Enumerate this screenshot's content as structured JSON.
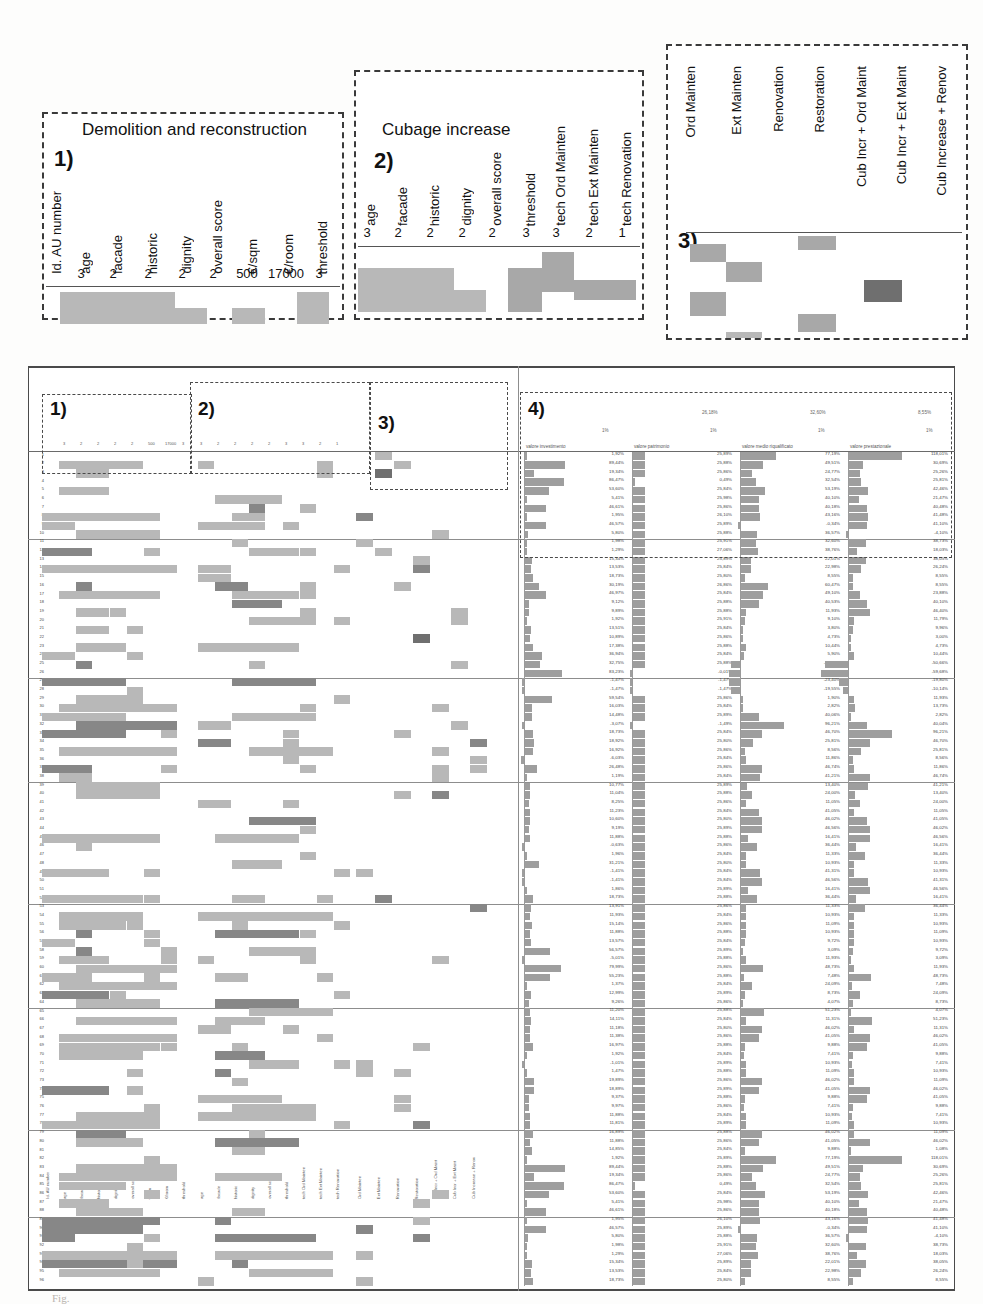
{
  "document": {
    "type": "figure",
    "caption": "Fig."
  },
  "colors": {
    "cell_light": "#b8b8b8",
    "cell_mid": "#a8a8a8",
    "cell_dark": "#878787",
    "cell_darkest": "#6f6f6f",
    "bar": "#9e9e9e",
    "frame": "#3a3a3a",
    "rule": "#555555",
    "background": "#ffffff"
  },
  "callouts": [
    {
      "id": "callout-1",
      "number": "1)",
      "title": "Demolition and reconstruction",
      "columns": [
        {
          "label": "Id. AU number",
          "value": ""
        },
        {
          "label": "age",
          "value": "3"
        },
        {
          "label": "facade",
          "value": "2"
        },
        {
          "label": "historic",
          "value": "2"
        },
        {
          "label": "dignity",
          "value": "2"
        },
        {
          "label": "overall score",
          "value": "2"
        },
        {
          "label": "€/sqm",
          "value": "500"
        },
        {
          "label": "€/room",
          "value": "17000"
        },
        {
          "label": "threshold",
          "value": "3"
        }
      ],
      "cells": [
        {
          "row": 0,
          "col_start": 1,
          "col_end": 5,
          "shade": "cell_light"
        },
        {
          "row": 0,
          "col_start": 8,
          "col_end": 9,
          "shade": "cell_light"
        },
        {
          "row": 1,
          "col_start": 1,
          "col_end": 4,
          "shade": "cell_light"
        },
        {
          "row": 1,
          "col_start": 6,
          "col_end": 7,
          "shade": "cell_light"
        },
        {
          "row": 1,
          "col_start": 8,
          "col_end": 9,
          "shade": "cell_light"
        }
      ]
    },
    {
      "id": "callout-2",
      "number": "2)",
      "title": "Cubage increase",
      "columns": [
        {
          "label": "age",
          "value": "3"
        },
        {
          "label": "facade",
          "value": "2"
        },
        {
          "label": "historic",
          "value": "2"
        },
        {
          "label": "dignity",
          "value": "2"
        },
        {
          "label": "overall score",
          "value": "2"
        },
        {
          "label": "threshold",
          "value": "3"
        },
        {
          "label": "tech Ord Mainten",
          "value": "3"
        },
        {
          "label": "tech Ext Mainten",
          "value": "2"
        },
        {
          "label": "tech Renovation",
          "value": "1"
        }
      ],
      "cells": [
        {
          "row": 0,
          "col_start": 5,
          "col_end": 7,
          "shade": "cell_mid"
        },
        {
          "row": 1,
          "col_start": 0,
          "col_end": 4,
          "shade": "cell_light"
        },
        {
          "row": 1,
          "col_start": 5,
          "col_end": 7,
          "shade": "cell_mid"
        },
        {
          "row": 1,
          "col_start": 7,
          "col_end": 9,
          "shade": "cell_mid"
        },
        {
          "row": 2,
          "col_start": 0,
          "col_end": 3,
          "shade": "cell_light"
        },
        {
          "row": 2,
          "col_start": 5,
          "col_end": 6,
          "shade": "cell_mid"
        },
        {
          "row": 2,
          "col_start": 7,
          "col_end": 9,
          "shade": "cell_mid"
        }
      ]
    },
    {
      "id": "callout-3",
      "number": "3)",
      "columns": [
        {
          "label": "Ord Mainten",
          "value": ""
        },
        {
          "label": "Ext Mainten",
          "value": ""
        },
        {
          "label": "Renovation",
          "value": ""
        },
        {
          "label": "Restoration",
          "value": ""
        },
        {
          "label": "Cub Incr + Ord Maint",
          "value": ""
        },
        {
          "label": "Cub Incr + Ext Maint",
          "value": ""
        },
        {
          "label": "Cub Increase + Renov",
          "value": ""
        }
      ],
      "cells": [
        {
          "row": 0,
          "col_start": 3,
          "col_end": 4,
          "shade": "cell_mid"
        },
        {
          "row": 1,
          "col_start": 0,
          "col_end": 1,
          "shade": "cell_mid"
        },
        {
          "row": 2,
          "col_start": 1,
          "col_end": 2,
          "shade": "cell_mid"
        },
        {
          "row": 3,
          "col_start": 5,
          "col_end": 6,
          "shade": "cell_darkest"
        },
        {
          "row": 4,
          "col_start": 0,
          "col_end": 1,
          "shade": "cell_mid"
        },
        {
          "row": 5,
          "col_start": 3,
          "col_end": 4,
          "shade": "cell_mid"
        },
        {
          "row": 6,
          "col_start": 1,
          "col_end": 2,
          "shade": "cell_light"
        }
      ]
    }
  ],
  "matrix": {
    "zoom_regions": [
      {
        "label": "1)",
        "source": "callout-1"
      },
      {
        "label": "2)",
        "source": "callout-2"
      },
      {
        "label": "3)",
        "source": "callout-3"
      },
      {
        "label": "4)",
        "source": "panel-4"
      }
    ],
    "row_count": 96,
    "section_breaks": [
      10,
      26,
      38,
      52,
      64,
      78,
      88
    ],
    "mini_headers_group1": [
      "Id. AU number",
      "age",
      "facade",
      "historic",
      "dignity",
      "overall score",
      "€/sqm",
      "€/room",
      "threshold"
    ],
    "mini_values_group1": [
      "",
      "3",
      "2",
      "2",
      "2",
      "2",
      "500",
      "17000",
      "3"
    ],
    "mini_headers_group2": [
      "age",
      "facade",
      "historic",
      "dignity",
      "overall score",
      "threshold",
      "tech Ord Mainten",
      "tech Ext Mainten",
      "tech Renovation"
    ],
    "mini_values_group2": [
      "3",
      "2",
      "2",
      "2",
      "2",
      "3",
      "3",
      "2",
      "1"
    ],
    "mini_headers_group3": [
      "Ord Mainten",
      "Ext Mainten",
      "Renovation",
      "Restoration",
      "Cub Incr + Ord Maint",
      "Cub Incr + Ext Maint",
      "Cub Increase + Renov"
    ]
  },
  "panel4": {
    "number": "4)",
    "columns": [
      {
        "header": "valore investimento",
        "tick_mid": "1%",
        "tick_top": ""
      },
      {
        "header": "valore patrimonio",
        "tick_mid": "1%",
        "tick_top": "26,18%"
      },
      {
        "header": "valore medio riqualificato",
        "tick_mid": "1%",
        "tick_top": "32,60%"
      },
      {
        "header": "valore prestazionale",
        "tick_mid": "1%",
        "tick_top": "8,55%"
      }
    ],
    "sample_values_col1": [
      "1,92%",
      "89,44%",
      "19,34%",
      "86,47%",
      "53,60%",
      "5,41%",
      "46,61%",
      "1,95%",
      "46,57%",
      "5,80%",
      "1,98%",
      "1,29%",
      "15,34%",
      "13,53%",
      "18,73%",
      "30,19%",
      "46,97%",
      "9,12%",
      "9,89%",
      "1,92%",
      "13,51%",
      "10,89%",
      "17,38%",
      "36,94%",
      "32,75%",
      "83,23%",
      "-1,47%",
      "-1,47%",
      "59,54%",
      "16,03%",
      "14,48%",
      "-3,07%",
      "18,73%",
      "18,92%",
      "16,92%",
      "-6,03%",
      "26,48%",
      "1,19%",
      "10,77%",
      "11,04%",
      "8,25%",
      "11,23%",
      "10,60%",
      "9,19%",
      "11,88%",
      "-0,63%",
      "1,96%",
      "31,21%",
      "-1,41%",
      "-1,41%",
      "1,86%",
      "18,73%",
      "13,91%",
      "11,93%",
      "15,14%",
      "11,88%",
      "13,57%",
      "56,57%",
      "-5,01%",
      "79,99%",
      "55,23%",
      "1,37%",
      "12,99%",
      "9,26%",
      "11,20%",
      "14,11%",
      "11,18%",
      "11,38%",
      "16,97%",
      "1,92%",
      "-1,01%",
      "1,47%",
      "19,89%",
      "18,89%",
      "9,37%",
      "9,97%",
      "11,88%",
      "11,81%",
      "16,89%",
      "11,88%",
      "14,85%"
    ],
    "sample_values_col2": [
      "25,89%",
      "25,88%",
      "25,86%",
      "0,49%",
      "25,84%",
      "25,98%",
      "25,86%",
      "26,10%",
      "25,89%",
      "25,88%",
      "25,91%",
      "27,06%",
      "25,89%",
      "25,84%",
      "25,80%",
      "26,86%",
      "25,84%",
      "25,88%",
      "25,88%",
      "25,91%",
      "25,84%",
      "25,86%",
      "25,88%",
      "25,84%",
      "25,88%",
      "-0,01%",
      "-1,47%",
      "-1,47%",
      "25,86%",
      "25,84%",
      "25,89%",
      "-1,49%",
      "25,84%",
      "25,80%",
      "25,86%",
      "25,84%",
      "25,86%",
      "25,84%",
      "25,89%",
      "25,88%",
      "25,86%",
      "25,84%",
      "25,80%",
      "25,89%",
      "25,88%",
      "25,86%",
      "25,84%",
      "25,80%",
      "25,84%",
      "25,84%",
      "25,89%",
      "25,88%",
      "25,86%",
      "25,84%",
      "25,86%",
      "25,88%",
      "25,84%",
      "25,89%",
      "25,88%",
      "25,86%",
      "25,88%",
      "25,84%",
      "25,89%",
      "25,86%",
      "25,88%",
      "25,84%",
      "25,80%",
      "25,86%",
      "25,88%",
      "25,84%",
      "25,89%",
      "25,88%",
      "25,86%",
      "25,89%",
      "25,88%",
      "25,86%",
      "25,84%",
      "25,89%",
      "25,88%",
      "25,86%",
      "25,84%"
    ],
    "sample_values_col3": [
      "77,19%",
      "49,51%",
      "24,77%",
      "32,54%",
      "53,19%",
      "40,10%",
      "40,18%",
      "43,16%",
      "-0,34%",
      "36,57%",
      "32,60%",
      "38,76%",
      "22,01%",
      "22,98%",
      "8,55%",
      "60,47%",
      "49,10%",
      "40,53%",
      "11,93%",
      "9,10%",
      "3,80%",
      "4,73%",
      "10,44%",
      "5,90%",
      "-20,65%",
      "-23,47%",
      "-23,40%",
      "-19,55%",
      "1,90%",
      "2,82%",
      "40,06%",
      "96,21%",
      "46,70%",
      "25,81%",
      "8,56%",
      "11,86%",
      "46,74%",
      "41,21%",
      "13,40%",
      "24,00%",
      "11,05%",
      "41,05%",
      "46,02%",
      "46,56%",
      "16,41%",
      "36,44%",
      "11,33%",
      "10,93%",
      "41,31%",
      "46,56%",
      "16,41%",
      "36,44%",
      "11,33%",
      "10,93%",
      "11,09%",
      "10,93%",
      "9,72%",
      "3,09%",
      "11,93%",
      "48,73%",
      "7,48%",
      "24,09%",
      "8,73%",
      "4,07%",
      "51,23%",
      "11,31%",
      "46,02%",
      "41,05%",
      "9,88%",
      "7,41%",
      "10,93%",
      "11,09%",
      "46,02%",
      "41,05%",
      "9,88%",
      "7,41%",
      "10,93%",
      "11,09%",
      "46,02%",
      "41,05%",
      "9,88%"
    ],
    "sample_values_col4": [
      "118,01%",
      "30,69%",
      "25,26%",
      "25,81%",
      "42,46%",
      "21,47%",
      "40,48%",
      "41,48%",
      "41,10%",
      "-4,10%",
      "38,73%",
      "18,03%",
      "38,05%",
      "26,24%",
      "8,55%",
      "8,55%",
      "23,88%",
      "40,10%",
      "46,40%",
      "11,79%",
      "9,96%",
      "3,00%",
      "4,73%",
      "10,44%",
      "-50,66%",
      "-59,68%",
      "-19,80%",
      "-10,14%",
      "11,93%",
      "13,73%",
      "2,82%",
      "40,04%",
      "96,21%",
      "46,70%",
      "25,81%",
      "8,56%",
      "11,86%",
      "46,74%",
      "41,21%",
      "13,40%",
      "24,00%",
      "11,05%",
      "41,05%",
      "46,02%",
      "46,56%",
      "16,41%",
      "36,44%",
      "11,33%",
      "10,93%",
      "41,31%",
      "46,56%",
      "16,41%",
      "36,44%",
      "11,33%",
      "10,93%",
      "11,09%",
      "10,93%",
      "9,72%",
      "3,09%",
      "11,93%",
      "48,73%",
      "7,48%",
      "24,09%",
      "8,73%",
      "4,07%",
      "51,23%",
      "11,31%",
      "46,02%",
      "41,05%",
      "9,88%",
      "7,41%",
      "10,93%",
      "11,09%",
      "46,02%",
      "41,05%",
      "9,88%",
      "7,41%",
      "10,93%",
      "11,09%",
      "46,02%",
      "1,08%"
    ]
  },
  "ghost_text": [
    "the layout of the alternative scenarios",
    "increase",
    "increase",
    "the renovation, the",
    "the assessment of the",
    "considered in the analysis",
    "for each of the"
  ]
}
